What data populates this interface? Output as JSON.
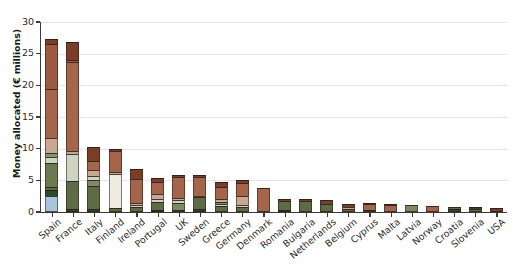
{
  "chart_data": {
    "type": "bar",
    "subtype": "stacked-bar",
    "title": "",
    "xlabel": "",
    "ylabel": "Money allocated (€ millions)",
    "ylim": [
      0,
      30
    ],
    "yticks": [
      0,
      5,
      10,
      15,
      20,
      25,
      30
    ],
    "grid": true,
    "legend": "none",
    "categories": [
      "Spain",
      "France",
      "Italy",
      "Finland",
      "Ireland",
      "Portugal",
      "UK",
      "Sweden",
      "Greece",
      "Germany",
      "Denmark",
      "Romania",
      "Bulgaria",
      "Netherlands",
      "Belgium",
      "Cyprus",
      "Malta",
      "Latvia",
      "Norway",
      "Croatia",
      "Slovenia",
      "USA"
    ],
    "totals": [
      27.3,
      26.8,
      10.3,
      9.9,
      6.8,
      5.3,
      5.9,
      5.8,
      4.8,
      5.0,
      3.8,
      2.1,
      2.0,
      1.9,
      1.2,
      1.5,
      1.3,
      1.1,
      1.0,
      0.85,
      0.75,
      0.6
    ],
    "colors": {
      "blue": "#aac4dd",
      "dark_green": "#2f4a2c",
      "olive": "#5d6b46",
      "light_olive": "#7d8a63",
      "pale_green": "#cdd4c2",
      "cream": "#efece2",
      "tan": "#c9a893",
      "brown": "#a5654b",
      "dark_brown": "#7c3d26",
      "mid_brown": "#8d5238"
    },
    "bars": [
      {
        "category": "Spain",
        "total": 27.3,
        "segments": [
          {
            "color": "#aac4dd",
            "value": 2.5
          },
          {
            "color": "#2f4a2c",
            "value": 1.0
          },
          {
            "color": "#5d6b46",
            "value": 0.5
          },
          {
            "color": "#6b7a50",
            "value": 3.7
          },
          {
            "color": "#cdd4c2",
            "value": 1.0
          },
          {
            "color": "#8a9470",
            "value": 0.6
          },
          {
            "color": "#c9a893",
            "value": 2.4
          },
          {
            "color": "#a5654b",
            "value": 7.8
          },
          {
            "color": "#9c5a40",
            "value": 7.1
          },
          {
            "color": "#7c3d26",
            "value": 0.7
          }
        ]
      },
      {
        "category": "France",
        "total": 26.8,
        "segments": [
          {
            "color": "#2f4a2c",
            "value": 0.5
          },
          {
            "color": "#5d6b46",
            "value": 4.4
          },
          {
            "color": "#cdd4c2",
            "value": 4.2
          },
          {
            "color": "#c9a893",
            "value": 0.6
          },
          {
            "color": "#a5654b",
            "value": 14.0
          },
          {
            "color": "#9c5a40",
            "value": 0.3
          },
          {
            "color": "#7c3d26",
            "value": 2.8
          }
        ]
      },
      {
        "category": "Italy",
        "total": 10.3,
        "segments": [
          {
            "color": "#2f4a2c",
            "value": 0.4
          },
          {
            "color": "#5d6b46",
            "value": 3.7
          },
          {
            "color": "#7d8a63",
            "value": 1.0
          },
          {
            "color": "#cdd4c2",
            "value": 0.6
          },
          {
            "color": "#c9a893",
            "value": 0.9
          },
          {
            "color": "#a5654b",
            "value": 1.5
          },
          {
            "color": "#7c3d26",
            "value": 2.2
          }
        ]
      },
      {
        "category": "Finland",
        "total": 9.9,
        "segments": [
          {
            "color": "#5d6b46",
            "value": 0.7
          },
          {
            "color": "#efece2",
            "value": 5.3
          },
          {
            "color": "#c9a893",
            "value": 0.3
          },
          {
            "color": "#a5654b",
            "value": 3.4
          },
          {
            "color": "#7c3d26",
            "value": 0.2
          }
        ]
      },
      {
        "category": "Ireland",
        "total": 6.8,
        "segments": [
          {
            "color": "#5d6b46",
            "value": 0.8
          },
          {
            "color": "#cdd4c2",
            "value": 0.3
          },
          {
            "color": "#c9a893",
            "value": 0.4
          },
          {
            "color": "#a5654b",
            "value": 3.7
          },
          {
            "color": "#7c3d26",
            "value": 1.6
          }
        ]
      },
      {
        "category": "Portugal",
        "total": 5.3,
        "segments": [
          {
            "color": "#2f4a2c",
            "value": 0.3
          },
          {
            "color": "#5d6b46",
            "value": 1.3
          },
          {
            "color": "#cdd4c2",
            "value": 0.5
          },
          {
            "color": "#c9a893",
            "value": 0.8
          },
          {
            "color": "#a5654b",
            "value": 1.9
          },
          {
            "color": "#7c3d26",
            "value": 0.5
          }
        ]
      },
      {
        "category": "UK",
        "total": 5.9,
        "segments": [
          {
            "color": "#5d6b46",
            "value": 0.2
          },
          {
            "color": "#7d8a63",
            "value": 1.2
          },
          {
            "color": "#cdd4c2",
            "value": 0.4
          },
          {
            "color": "#c9a893",
            "value": 0.4
          },
          {
            "color": "#a5654b",
            "value": 3.3
          },
          {
            "color": "#7c3d26",
            "value": 0.4
          }
        ]
      },
      {
        "category": "Sweden",
        "total": 5.8,
        "segments": [
          {
            "color": "#2f4a2c",
            "value": 0.4
          },
          {
            "color": "#5d6b46",
            "value": 1.9
          },
          {
            "color": "#cdd4c2",
            "value": 0.3
          },
          {
            "color": "#a5654b",
            "value": 2.9
          },
          {
            "color": "#7c3d26",
            "value": 0.3
          }
        ]
      },
      {
        "category": "Greece",
        "total": 4.8,
        "segments": [
          {
            "color": "#5d6b46",
            "value": 0.9
          },
          {
            "color": "#cdd4c2",
            "value": 0.3
          },
          {
            "color": "#7d8a63",
            "value": 0.4
          },
          {
            "color": "#c9a893",
            "value": 0.5
          },
          {
            "color": "#a5654b",
            "value": 1.9
          },
          {
            "color": "#7c3d26",
            "value": 0.8
          }
        ]
      },
      {
        "category": "Germany",
        "total": 5.0,
        "segments": [
          {
            "color": "#5d6b46",
            "value": 0.8
          },
          {
            "color": "#cdd4c2",
            "value": 0.3
          },
          {
            "color": "#c9a893",
            "value": 1.5
          },
          {
            "color": "#a5654b",
            "value": 2.0
          },
          {
            "color": "#7c3d26",
            "value": 0.4
          }
        ]
      },
      {
        "category": "Denmark",
        "total": 3.8,
        "segments": [
          {
            "color": "#a5654b",
            "value": 3.8
          }
        ]
      },
      {
        "category": "Romania",
        "total": 2.1,
        "segments": [
          {
            "color": "#2f4a2c",
            "value": 0.3
          },
          {
            "color": "#5d6b46",
            "value": 1.5
          },
          {
            "color": "#7c3d26",
            "value": 0.3
          }
        ]
      },
      {
        "category": "Bulgaria",
        "total": 2.0,
        "segments": [
          {
            "color": "#5d6b46",
            "value": 1.8
          },
          {
            "color": "#7c3d26",
            "value": 0.2
          }
        ]
      },
      {
        "category": "Netherlands",
        "total": 1.9,
        "segments": [
          {
            "color": "#5d6b46",
            "value": 1.3
          },
          {
            "color": "#7c3d26",
            "value": 0.6
          }
        ]
      },
      {
        "category": "Belgium",
        "total": 1.2,
        "segments": [
          {
            "color": "#5d6b46",
            "value": 0.4
          },
          {
            "color": "#c9a893",
            "value": 0.4
          },
          {
            "color": "#7c3d26",
            "value": 0.4
          }
        ]
      },
      {
        "category": "Cyprus",
        "total": 1.5,
        "segments": [
          {
            "color": "#5d6b46",
            "value": 0.2
          },
          {
            "color": "#a5654b",
            "value": 1.0
          },
          {
            "color": "#7c3d26",
            "value": 0.3
          }
        ]
      },
      {
        "category": "Malta",
        "total": 1.3,
        "segments": [
          {
            "color": "#a5654b",
            "value": 1.1
          },
          {
            "color": "#7c3d26",
            "value": 0.2
          }
        ]
      },
      {
        "category": "Latvia",
        "total": 1.1,
        "segments": [
          {
            "color": "#7d8a63",
            "value": 1.1
          }
        ]
      },
      {
        "category": "Norway",
        "total": 1.0,
        "segments": [
          {
            "color": "#a5654b",
            "value": 1.0
          }
        ]
      },
      {
        "category": "Croatia",
        "total": 0.85,
        "segments": [
          {
            "color": "#2f4a2c",
            "value": 0.45
          },
          {
            "color": "#5d6b46",
            "value": 0.4
          }
        ]
      },
      {
        "category": "Slovenia",
        "total": 0.75,
        "segments": [
          {
            "color": "#5d6b46",
            "value": 0.55
          },
          {
            "color": "#2f4a2c",
            "value": 0.2
          }
        ]
      },
      {
        "category": "USA",
        "total": 0.6,
        "segments": [
          {
            "color": "#7c3d26",
            "value": 0.6
          }
        ]
      }
    ]
  }
}
